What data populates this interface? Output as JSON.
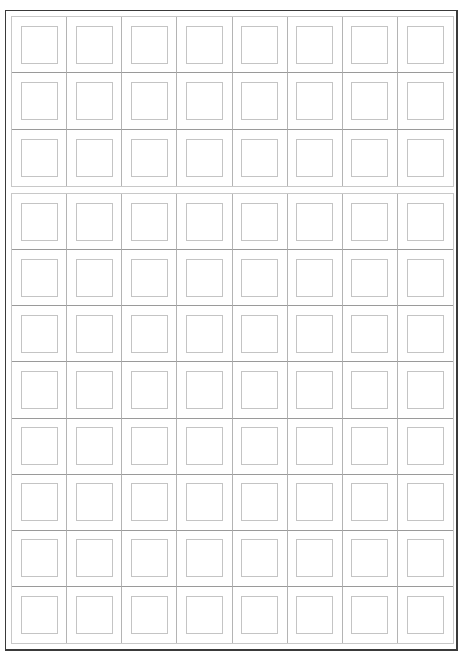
{
  "worksheet": {
    "type": "writing-practice-grid",
    "columns": 8,
    "blocks": [
      {
        "name": "top-block",
        "rows": 3
      },
      {
        "name": "bottom-block",
        "rows": 8
      }
    ],
    "total_cells": 88,
    "colors": {
      "frame": "#3a3a3a",
      "cell_line": "#b4b4b4",
      "square_line": "#c4c4c4",
      "background": "#ffffff"
    }
  }
}
